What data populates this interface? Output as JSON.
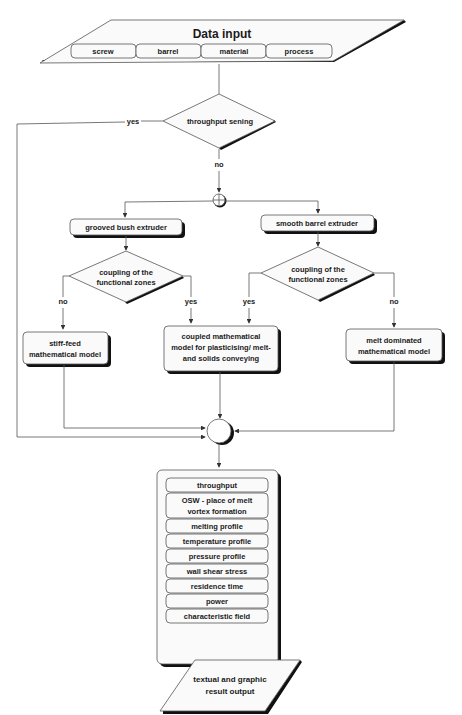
{
  "data_input": {
    "title": "Data input",
    "tabs": [
      "screw",
      "barrel",
      "material",
      "process"
    ]
  },
  "decision_throughput": {
    "label": "throughput sening",
    "yes": "yes",
    "no": "no"
  },
  "left_branch": {
    "box": "grooved bush extruder",
    "decision": [
      "coupling of the",
      "functional zones"
    ],
    "no": "no",
    "yes": "yes",
    "model": [
      "stiff-feed",
      "mathematical model"
    ]
  },
  "right_branch": {
    "box": "smooth barrel extruder",
    "decision": [
      "coupling of the",
      "functional zones"
    ],
    "no": "no",
    "yes": "yes",
    "model": [
      "melt dominated",
      "mathematical model"
    ]
  },
  "coupled_model": [
    "coupled mathematical",
    "model for plasticising/ melt-",
    "and solids conveying"
  ],
  "results": [
    [
      "throughput"
    ],
    [
      "OSW - place of melt",
      "vortex formation"
    ],
    [
      "melting profile"
    ],
    [
      "temperature profile"
    ],
    [
      "pressure profile"
    ],
    [
      "wall shear stress"
    ],
    [
      "residence time"
    ],
    [
      "power"
    ],
    [
      "characteristic field"
    ]
  ],
  "output": [
    "textual and graphic",
    "result output"
  ]
}
